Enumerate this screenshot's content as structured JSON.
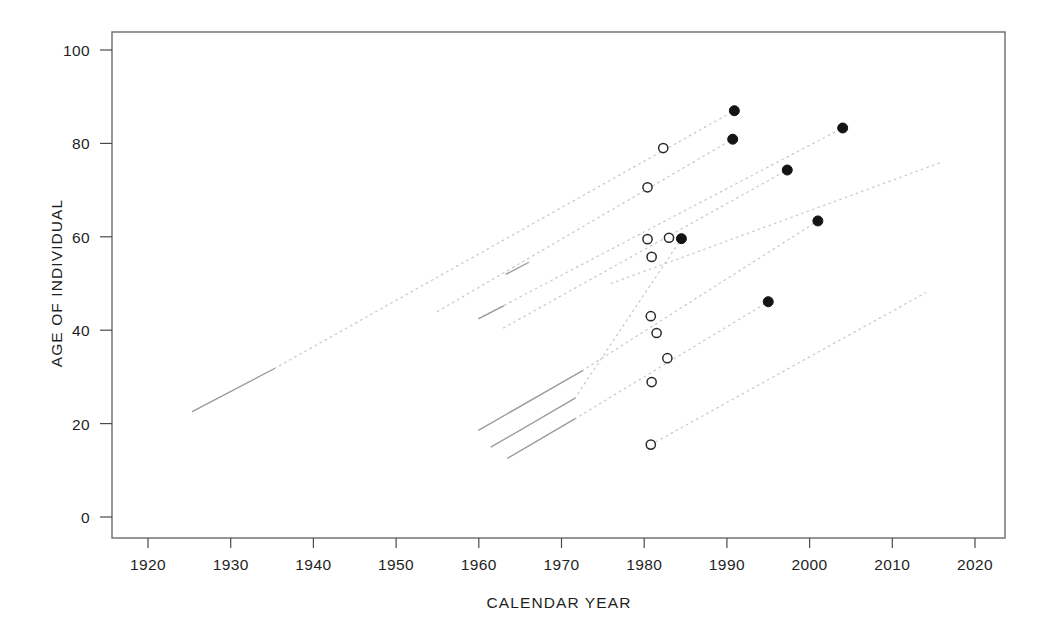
{
  "chart_data": {
    "type": "scatter",
    "title": "",
    "xlabel": "CALENDAR YEAR",
    "ylabel": "AGE OF INDIVIDUAL",
    "xlim": [
      1915,
      2024
    ],
    "ylim": [
      -3,
      104
    ],
    "xticks": [
      1920,
      1930,
      1940,
      1950,
      1960,
      1970,
      1980,
      1990,
      2000,
      2010,
      2020
    ],
    "yticks": [
      0,
      20,
      40,
      60,
      80,
      100
    ],
    "grid": false,
    "legend_position": "none",
    "series": [
      {
        "name": "open-circle-observations",
        "marker": "open-circle",
        "points": [
          {
            "x": 1982.3,
            "y": 79.0
          },
          {
            "x": 1980.4,
            "y": 70.6
          },
          {
            "x": 1980.4,
            "y": 59.5
          },
          {
            "x": 1983.0,
            "y": 59.8
          },
          {
            "x": 1980.9,
            "y": 55.7
          },
          {
            "x": 1980.8,
            "y": 43.0
          },
          {
            "x": 1981.5,
            "y": 39.4
          },
          {
            "x": 1982.8,
            "y": 34.0
          },
          {
            "x": 1980.9,
            "y": 28.9
          },
          {
            "x": 1980.8,
            "y": 15.5
          }
        ]
      },
      {
        "name": "filled-circle-observations",
        "marker": "filled-circle",
        "points": [
          {
            "x": 1990.9,
            "y": 87.0
          },
          {
            "x": 1990.7,
            "y": 80.9
          },
          {
            "x": 2004.0,
            "y": 83.3
          },
          {
            "x": 1997.3,
            "y": 74.3
          },
          {
            "x": 2001.0,
            "y": 63.4
          },
          {
            "x": 1984.5,
            "y": 59.6
          },
          {
            "x": 1995.0,
            "y": 46.1
          }
        ]
      }
    ],
    "cohort_lines": [
      {
        "name": "cohort-1",
        "solid": {
          "x1": 1925.4,
          "y1": 22.6,
          "x2": 1935.3,
          "y2": 31.8
        },
        "dotted": {
          "x1": 1935.3,
          "y1": 31.8,
          "x2": 1990.9,
          "y2": 87.0
        }
      },
      {
        "name": "cohort-2",
        "solid": {
          "x1": 1963.3,
          "y1": 52.0,
          "x2": 1966.0,
          "y2": 54.5
        },
        "dotted": {
          "x1": 1955.0,
          "y1": 44.0,
          "x2": 1990.7,
          "y2": 80.9
        }
      },
      {
        "name": "cohort-3",
        "solid": {
          "x1": 1960.0,
          "y1": 42.5,
          "x2": 1963.0,
          "y2": 45.2
        },
        "dotted": {
          "x1": 1960.0,
          "y1": 42.5,
          "x2": 2004.0,
          "y2": 83.3
        }
      },
      {
        "name": "cohort-4",
        "dotted": {
          "x1": 1963.0,
          "y1": 40.5,
          "x2": 1997.3,
          "y2": 74.3
        }
      },
      {
        "name": "cohort-5",
        "solid": {
          "x1": 1960.0,
          "y1": 18.6,
          "x2": 1972.5,
          "y2": 31.3
        },
        "dotted": {
          "x1": 1972.5,
          "y1": 31.3,
          "x2": 2001.0,
          "y2": 63.4
        }
      },
      {
        "name": "cohort-6",
        "solid": {
          "x1": 1961.5,
          "y1": 15.0,
          "x2": 1971.6,
          "y2": 25.4
        },
        "dotted": {
          "x1": 1971.6,
          "y1": 25.4,
          "x2": 1984.5,
          "y2": 59.6
        }
      },
      {
        "name": "cohort-7",
        "solid": {
          "x1": 1963.5,
          "y1": 12.6,
          "x2": 1971.6,
          "y2": 21.0
        },
        "dotted": {
          "x1": 1971.6,
          "y1": 21.0,
          "x2": 1995.0,
          "y2": 46.1
        }
      },
      {
        "name": "cohort-8",
        "dotted": {
          "x1": 1980.8,
          "y1": 15.5,
          "x2": 2014.0,
          "y2": 48.0
        }
      },
      {
        "name": "cohort-9",
        "dotted": {
          "x1": 1976.0,
          "y1": 50.0,
          "x2": 2016.0,
          "y2": 76.0
        }
      }
    ]
  }
}
